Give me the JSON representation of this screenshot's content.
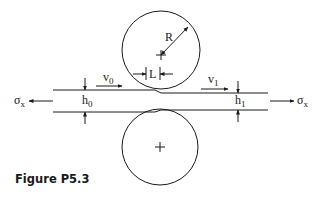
{
  "figure": {
    "caption": "Figure P5.3",
    "colors": {
      "stroke": "#1a1a1a",
      "background": "#ffffff"
    },
    "labels": {
      "radius": "R",
      "contact_length": "L",
      "entry_velocity": {
        "base": "v",
        "sub": "0"
      },
      "exit_velocity": {
        "base": "v",
        "sub": "1"
      },
      "entry_thickness": {
        "base": "h",
        "sub": "0"
      },
      "exit_thickness": {
        "base": "h",
        "sub": "1"
      },
      "back_tension": {
        "base": "σ",
        "sub": "x"
      },
      "front_tension": {
        "base": "σ",
        "sub": "x"
      }
    },
    "elements": {
      "top_roll": "circle with center cross",
      "bottom_roll": "circle with center cross",
      "strip": "sheet passing between rolls, thicker at entry (left) than exit (right)"
    }
  }
}
